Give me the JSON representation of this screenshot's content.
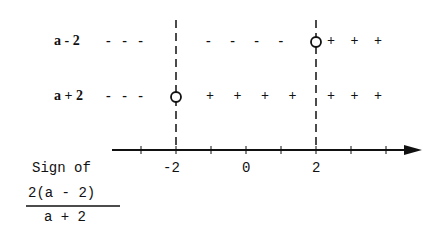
{
  "rows": [
    {
      "label": "a - 2",
      "signs_left": "- - -",
      "signs_mid": "- - - -",
      "signs_right": "+ + +",
      "zero_at": "2"
    },
    {
      "label": "a + 2",
      "signs_left": "- - -",
      "signs_mid": "+ + + +",
      "signs_right": "+ + +",
      "zero_at": "-2"
    }
  ],
  "axis": {
    "tick_labels": [
      "-2",
      "0",
      "2"
    ]
  },
  "caption": {
    "line1": "Sign of",
    "numerator": "2(a - 2)",
    "denominator": "a + 2"
  }
}
